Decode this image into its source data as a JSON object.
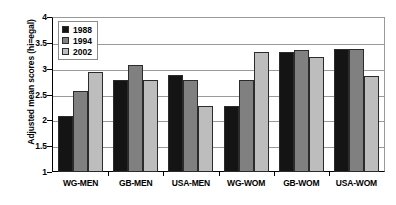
{
  "chart_data": {
    "type": "bar",
    "title": "",
    "subtitle": "",
    "xlabel": "",
    "ylabel": "Adjusted mean scores (hi=egal)",
    "categories": [
      "WG-MEN",
      "GB-MEN",
      "USA-MEN",
      "WG-WOM",
      "GB-WOM",
      "USA-WOM"
    ],
    "series": [
      {
        "name": "1988",
        "color": "#141414",
        "values": [
          2.1,
          2.8,
          2.9,
          2.3,
          3.35,
          3.4
        ]
      },
      {
        "name": "1994",
        "color": "#808080",
        "values": [
          2.58,
          3.1,
          2.8,
          2.8,
          3.38,
          3.4
        ]
      },
      {
        "name": "2002",
        "color": "#bdbdbd",
        "values": [
          2.95,
          2.8,
          2.3,
          3.35,
          3.25,
          2.88
        ]
      }
    ],
    "ylim": [
      1,
      4
    ],
    "yticks": [
      1,
      1.5,
      2,
      2.5,
      3,
      3.5,
      4
    ],
    "ytick_labels": [
      "1",
      "1.5",
      "2",
      "2.5",
      "3",
      "3.5",
      "4"
    ],
    "grid": true,
    "grid_axis": "y",
    "legend_position": "top-left",
    "plot_background": "#ffffff",
    "axis_color": "#000000",
    "gridline_color": "#9a9a9a"
  }
}
